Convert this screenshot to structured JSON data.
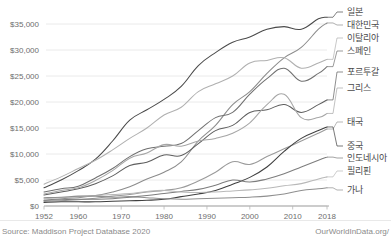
{
  "chart_data": {
    "type": "line",
    "title": "",
    "subtitle": "",
    "xlabel": "",
    "ylabel": "",
    "xlim": [
      1952,
      2018
    ],
    "ylim": [
      0,
      36500
    ],
    "grid": true,
    "legend_position": "right-inline",
    "x_ticks": [
      "1952",
      "1960",
      "1970",
      "1980",
      "1990",
      "2000",
      "2010",
      "2018"
    ],
    "x_tick_values": [
      1952,
      1960,
      1970,
      1980,
      1990,
      2000,
      2010,
      2018
    ],
    "y_ticks": [
      "$0",
      "$5,000",
      "$10,000",
      "$15,000",
      "$20,000",
      "$25,000",
      "$30,000",
      "$35,000"
    ],
    "y_tick_values": [
      0,
      5000,
      10000,
      15000,
      20000,
      25000,
      30000,
      35000
    ],
    "x": [
      1952,
      1956,
      1960,
      1964,
      1968,
      1972,
      1976,
      1980,
      1984,
      1988,
      1992,
      1996,
      2000,
      2004,
      2008,
      2012,
      2016,
      2018
    ],
    "series": [
      {
        "name": "일본",
        "color": "#4a4a4a",
        "label_y": 12,
        "values": [
          3500,
          5000,
          6800,
          9000,
          12500,
          16500,
          18500,
          20500,
          23000,
          27000,
          29500,
          31500,
          32500,
          34000,
          34500,
          34000,
          36000,
          36300
        ]
      },
      {
        "name": "대한민국",
        "color": "#8c8c8c",
        "label_y": 25,
        "values": [
          1100,
          1400,
          1600,
          2000,
          2700,
          3700,
          5200,
          6500,
          8500,
          12500,
          15500,
          19500,
          22000,
          25500,
          28500,
          30500,
          34000,
          35200
        ]
      },
      {
        "name": "이탈리아",
        "color": "#b0b0b0",
        "label_y": 38,
        "values": [
          4200,
          5600,
          7200,
          8800,
          10800,
          13000,
          15000,
          17500,
          19000,
          22000,
          23500,
          25000,
          27500,
          28000,
          28500,
          26500,
          27500,
          28200
        ]
      },
      {
        "name": "스페인",
        "color": "#707070",
        "label_y": 51,
        "values": [
          2700,
          3300,
          3800,
          5400,
          7200,
          9500,
          11000,
          11500,
          12000,
          14500,
          17000,
          18000,
          21500,
          24500,
          26500,
          24000,
          25500,
          26800
        ]
      },
      {
        "name": "포르투갈",
        "color": "#5e5e5e",
        "label_y": 72,
        "values": [
          2100,
          2700,
          3300,
          4300,
          5800,
          7800,
          8400,
          9800,
          9700,
          12000,
          14500,
          15500,
          18000,
          18500,
          19500,
          18000,
          19500,
          20400
        ]
      },
      {
        "name": "그리스",
        "color": "#a6a6a6",
        "label_y": 88,
        "values": [
          2300,
          3000,
          3500,
          4900,
          6800,
          9200,
          10200,
          11800,
          11500,
          12500,
          13000,
          14000,
          16000,
          19500,
          21500,
          17000,
          17000,
          17800
        ]
      },
      {
        "name": "태국",
        "color": "#9a9a9a",
        "label_y": 122,
        "values": [
          900,
          1000,
          1200,
          1500,
          1900,
          2200,
          2700,
          3000,
          3500,
          4800,
          6500,
          8500,
          8000,
          9500,
          11000,
          12500,
          14000,
          14800
        ]
      },
      {
        "name": "중국",
        "color": "#3f3f3f",
        "label_y": 146,
        "values": [
          700,
          800,
          800,
          800,
          900,
          1000,
          1100,
          1300,
          1800,
          2300,
          3000,
          4200,
          5500,
          7500,
          10500,
          13000,
          14500,
          15200
        ]
      },
      {
        "name": "인도네시아",
        "color": "#7d7d7d",
        "label_y": 158,
        "values": [
          1100,
          1200,
          1300,
          1300,
          1400,
          1700,
          2000,
          2400,
          2800,
          3200,
          4000,
          5000,
          4600,
          5200,
          6200,
          7500,
          8800,
          9400
        ]
      },
      {
        "name": "필리핀",
        "color": "#b8b8b8",
        "label_y": 171,
        "values": [
          1400,
          1600,
          1800,
          2000,
          2200,
          2400,
          2800,
          3000,
          2700,
          2600,
          2700,
          2900,
          3100,
          3400,
          3900,
          4300,
          5200,
          5600
        ]
      },
      {
        "name": "가나",
        "color": "#8f8f8f",
        "label_y": 190,
        "values": [
          1600,
          1700,
          1900,
          1900,
          1700,
          1800,
          1600,
          1400,
          1300,
          1400,
          1500,
          1600,
          1700,
          1900,
          2300,
          3000,
          3300,
          3500
        ]
      }
    ]
  },
  "footer": {
    "source": "Source: Maddison Project Database 2020",
    "attribution": "OurWorldInData.org/"
  }
}
